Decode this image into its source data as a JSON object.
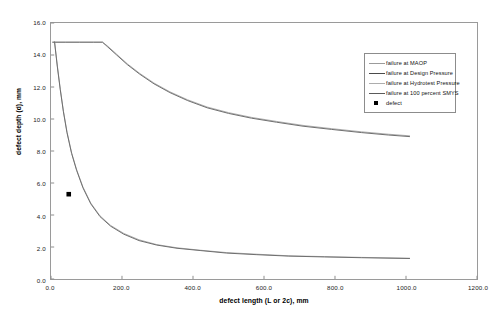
{
  "chart_data": {
    "type": "line",
    "title": "",
    "xlabel": "defect length (L or 2c), mm",
    "ylabel": "defect depth (d), mm",
    "xlim": [
      0.0,
      1200.0
    ],
    "ylim": [
      0.0,
      16.0
    ],
    "xticks": [
      "0.0",
      "200.0",
      "400.0",
      "600.0",
      "800.0",
      "1000.0",
      "1200.0"
    ],
    "xtick_values": [
      0,
      200,
      400,
      600,
      800,
      1000,
      1200
    ],
    "yticks": [
      "0.0",
      "2.0",
      "4.0",
      "6.0",
      "8.0",
      "10.0",
      "12.0",
      "14.0",
      "16.0"
    ],
    "ytick_values": [
      0,
      2,
      4,
      6,
      8,
      10,
      12,
      14,
      16
    ],
    "grid": false,
    "legend_position": "top-right-inside",
    "series": [
      {
        "name": "failure at MAOP",
        "color": "#9b9b9b",
        "width": 0.8,
        "x": [
          5,
          40,
          80,
          120,
          145,
          160,
          185,
          215,
          250,
          290,
          335,
          385,
          440,
          500,
          565,
          635,
          710,
          790,
          875,
          950,
          1010
        ],
        "y": [
          14.8,
          14.8,
          14.8,
          14.8,
          14.8,
          14.55,
          14.05,
          13.45,
          12.85,
          12.25,
          11.7,
          11.2,
          10.75,
          10.4,
          10.1,
          9.85,
          9.6,
          9.4,
          9.2,
          9.05,
          8.95
        ]
      },
      {
        "name": "failure at Design Pressure",
        "color": "#6f6f6f",
        "width": 1.0,
        "x": [
          5,
          40,
          80,
          120,
          145,
          160,
          185,
          215,
          250,
          290,
          335,
          385,
          440,
          500,
          565,
          635,
          710,
          790,
          875,
          950,
          1010
        ],
        "y": [
          14.8,
          14.8,
          14.8,
          14.8,
          14.8,
          14.5,
          14.0,
          13.4,
          12.8,
          12.2,
          11.65,
          11.15,
          10.7,
          10.35,
          10.05,
          9.8,
          9.55,
          9.35,
          9.15,
          9.0,
          8.9
        ]
      },
      {
        "name": "failure at Hydrotest Pressure",
        "color": "#9b9b9b",
        "width": 0.8,
        "x": [
          10,
          18,
          26,
          35,
          45,
          58,
          72,
          90,
          112,
          138,
          168,
          205,
          248,
          298,
          355,
          420,
          495,
          580,
          670,
          770,
          875,
          1010
        ],
        "y": [
          14.85,
          13.3,
          11.9,
          10.5,
          9.2,
          7.9,
          6.85,
          5.75,
          4.75,
          3.95,
          3.35,
          2.85,
          2.45,
          2.15,
          1.95,
          1.8,
          1.65,
          1.55,
          1.45,
          1.4,
          1.35,
          1.3
        ]
      },
      {
        "name": "failure at 100 percent SMYS",
        "color": "#6f6f6f",
        "width": 1.0,
        "x": [
          10,
          18,
          26,
          35,
          45,
          58,
          72,
          90,
          112,
          138,
          168,
          205,
          248,
          298,
          355,
          420,
          495,
          580,
          670,
          770,
          875,
          1010
        ],
        "y": [
          14.8,
          13.25,
          11.85,
          10.45,
          9.15,
          7.85,
          6.8,
          5.7,
          4.7,
          3.9,
          3.3,
          2.8,
          2.4,
          2.12,
          1.92,
          1.78,
          1.62,
          1.52,
          1.43,
          1.38,
          1.33,
          1.28
        ]
      }
    ],
    "points": [
      {
        "name": "defect",
        "marker": "square",
        "color": "#000000",
        "x": 50,
        "y": 5.3
      }
    ],
    "legend": [
      {
        "label": "failure at MAOP",
        "type": "line",
        "color": "#9b9b9b",
        "width": 0.8
      },
      {
        "label": "failure at Design Pressure",
        "type": "line",
        "color": "#4a4a4a",
        "width": 1.4
      },
      {
        "label": "failure at Hydrotest Pressure",
        "type": "line",
        "color": "#adadad",
        "width": 0.8
      },
      {
        "label": "failure at 100 percent SMYS",
        "type": "line",
        "color": "#5a5a5a",
        "width": 1.4
      },
      {
        "label": "defect",
        "type": "marker",
        "color": "#000000",
        "width": 0
      }
    ]
  }
}
